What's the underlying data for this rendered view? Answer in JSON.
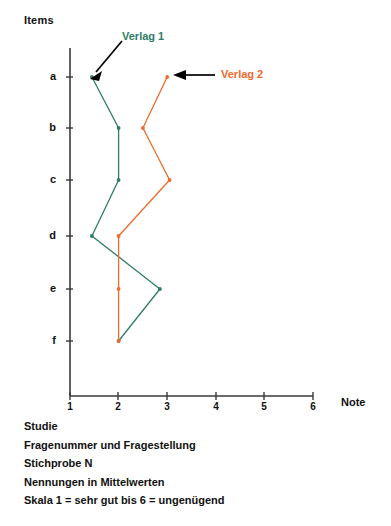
{
  "axes": {
    "y_title": "Items",
    "x_title": "Note",
    "y_ticks": [
      "a",
      "b",
      "c",
      "d",
      "e",
      "f"
    ],
    "x_ticks": [
      "1",
      "2",
      "3",
      "4",
      "5",
      "6"
    ]
  },
  "annotations": {
    "series1_label": "Verlag 1",
    "series2_label": "Verlag 2"
  },
  "colors": {
    "series1": "#2e7d64",
    "series2": "#ef6a2e",
    "axis": "#3a3a3a",
    "arrow": "#000000"
  },
  "caption": {
    "lines": [
      "Studie",
      "Fragenummer und Fragestellung",
      "Stichprobe N",
      "Nennungen in Mittelwerten",
      "Skala 1 = sehr gut bis 6 = ungenügend"
    ]
  },
  "chart_data": {
    "type": "line",
    "title": "",
    "xlabel": "Note",
    "ylabel": "Items",
    "orientation": "horizontal-value",
    "categories": [
      "a",
      "b",
      "c",
      "d",
      "e",
      "f"
    ],
    "xlim": [
      1,
      6
    ],
    "xticks": [
      1,
      2,
      3,
      4,
      5,
      6
    ],
    "grid": false,
    "legend": "annotated-arrows",
    "series": [
      {
        "name": "Verlag 1",
        "color": "#2e7d64",
        "values": [
          1.45,
          2.0,
          2.0,
          1.45,
          2.85,
          2.0
        ]
      },
      {
        "name": "Verlag 2",
        "color": "#ef6a2e",
        "values": [
          3.0,
          2.5,
          3.05,
          2.0,
          2.0,
          2.0
        ]
      }
    ],
    "notes": [
      "Skala 1 = sehr gut bis 6 = ungenügend",
      "Nennungen in Mittelwerten"
    ]
  }
}
